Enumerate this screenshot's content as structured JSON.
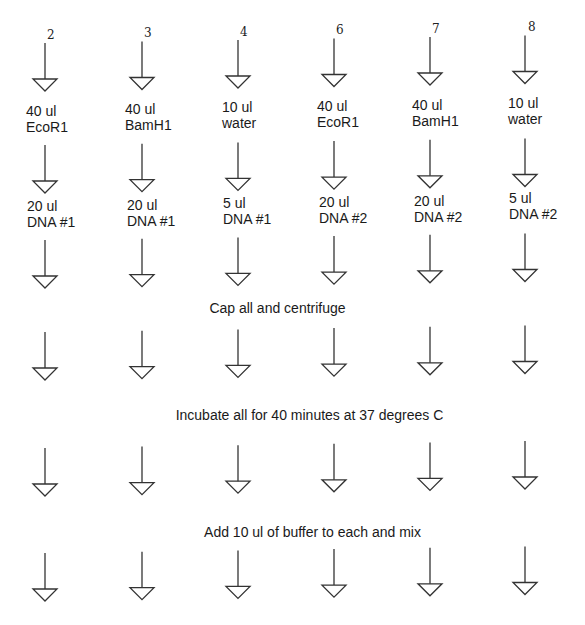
{
  "diagram": {
    "tubes": [
      {
        "number": "2",
        "enzyme_volume": "40 ul",
        "enzyme": "EcoR1",
        "dna_volume": "20 ul",
        "dna": "DNA #1"
      },
      {
        "number": "3",
        "enzyme_volume": "40 ul",
        "enzyme": "BamH1",
        "dna_volume": "20 ul",
        "dna": "DNA #1"
      },
      {
        "number": "4",
        "enzyme_volume": "10 ul",
        "enzyme": "water",
        "dna_volume": "5 ul",
        "dna": "DNA #1"
      },
      {
        "number": "6",
        "enzyme_volume": "40 ul",
        "enzyme": "EcoR1",
        "dna_volume": "20 ul",
        "dna": "DNA #2"
      },
      {
        "number": "7",
        "enzyme_volume": "40 ul",
        "enzyme": "BamH1",
        "dna_volume": "20 ul",
        "dna": "DNA #2"
      },
      {
        "number": "8",
        "enzyme_volume": "10 ul",
        "enzyme": "water",
        "dna_volume": "5 ul",
        "dna": "DNA #2"
      }
    ],
    "steps": [
      {
        "text": "Cap all and centrifuge"
      },
      {
        "text": "Incubate all for 40 minutes at 37 degrees C"
      },
      {
        "text": "Add 10 ul of buffer to each and mix"
      }
    ],
    "arrow_icon": "down-arrow-triangle-icon"
  }
}
